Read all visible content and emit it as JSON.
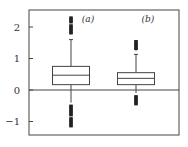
{
  "chart_data": {
    "type": "box",
    "title": "",
    "xlabel": "",
    "ylabel": "",
    "ylim": [
      -1.5,
      2.5
    ],
    "yticks": [
      -1,
      0,
      1,
      2
    ],
    "ytick_labels": [
      "−1",
      "0",
      "1",
      "2"
    ],
    "reference_line": 0,
    "grid": false,
    "series": [
      {
        "name": "(a)",
        "q1": 0.17,
        "median": 0.47,
        "q3": 0.75,
        "whisker_low": -0.4,
        "whisker_high": 1.6,
        "outliers_high": [
          1.8,
          1.85,
          1.9,
          1.95,
          2.0,
          2.05,
          2.15,
          2.2,
          2.25,
          2.3
        ],
        "outliers_low": [
          -0.5,
          -0.55,
          -0.6,
          -0.65,
          -0.7,
          -0.75,
          -0.8,
          -0.9,
          -0.95,
          -1.0,
          -1.05,
          -1.1,
          -1.15
        ]
      },
      {
        "name": "(b)",
        "q1": 0.17,
        "median": 0.37,
        "q3": 0.55,
        "whisker_low": -0.1,
        "whisker_high": 1.13,
        "outliers_high": [
          1.3,
          1.35,
          1.4,
          1.45,
          1.5,
          1.55
        ],
        "outliers_low": [
          -0.2,
          -0.25,
          -0.3,
          -0.35,
          -0.4,
          -0.45
        ]
      }
    ]
  }
}
